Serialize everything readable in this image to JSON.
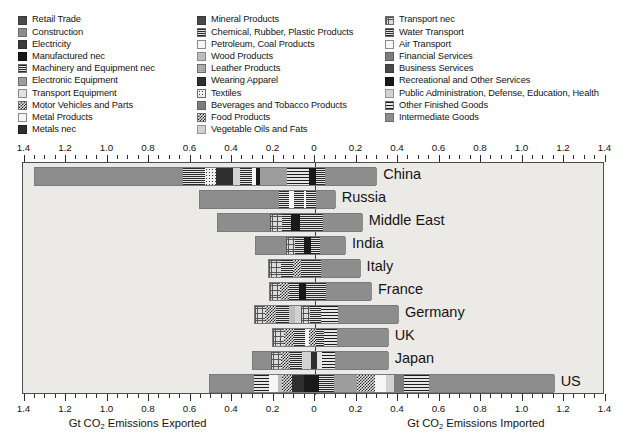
{
  "legend": {
    "columns": [
      {
        "items": [
          {
            "label": "Retail Trade",
            "pattern": "p-solid-dark"
          },
          {
            "label": "Construction",
            "pattern": "p-solid-mid"
          },
          {
            "label": "Electricity",
            "pattern": "p-solid-dark2"
          },
          {
            "label": "Manufactured nec",
            "pattern": "p-black"
          },
          {
            "label": "Machinery and Equipment nec",
            "pattern": "p-hline"
          },
          {
            "label": "Electronic Equipment",
            "pattern": "p-dot"
          },
          {
            "label": "Transport Equipment",
            "pattern": "p-light"
          },
          {
            "label": "Motor Vehicles and Parts",
            "pattern": "p-check"
          },
          {
            "label": "Metal Products",
            "pattern": "p-white"
          },
          {
            "label": "Metals nec",
            "pattern": "p-solid-darker"
          }
        ]
      },
      {
        "items": [
          {
            "label": "Mineral Products",
            "pattern": "p-solid-dark"
          },
          {
            "label": "Chemical, Rubber, Plastic Products",
            "pattern": "p-hline"
          },
          {
            "label": "Petroleum, Coal Products",
            "pattern": "p-white"
          },
          {
            "label": "Wood Products",
            "pattern": "p-lgray"
          },
          {
            "label": "Leather Products",
            "pattern": "p-mid-dot"
          },
          {
            "label": "Wearing Apparel",
            "pattern": "p-solid-darker"
          },
          {
            "label": "Textiles",
            "pattern": "p-sparse-dot"
          },
          {
            "label": "Beverages and Tobacco Products",
            "pattern": "p-med2"
          },
          {
            "label": "Food Products",
            "pattern": "p-check"
          },
          {
            "label": "Vegetable Oils and Fats",
            "pattern": "p-vlgray"
          }
        ]
      },
      {
        "items": [
          {
            "label": "Transport nec",
            "pattern": "p-grid"
          },
          {
            "label": "Water Transport",
            "pattern": "p-hline"
          },
          {
            "label": "Air Transport",
            "pattern": "p-white"
          },
          {
            "label": "Financial Services",
            "pattern": "p-med2"
          },
          {
            "label": "Business Services",
            "pattern": "p-solid-dark"
          },
          {
            "label": "Recreational and Other Services",
            "pattern": "p-black"
          },
          {
            "label": "Public Administration, Defense, Education, Health",
            "pattern": "p-vlgray"
          },
          {
            "label": "Other Finished Goods",
            "pattern": "p-hline-wide"
          },
          {
            "label": "Intermediate Goods",
            "pattern": "p-solid-mid"
          }
        ]
      }
    ]
  },
  "chart_data": {
    "type": "bar",
    "orientation": "horizontal-diverging-stacked",
    "title": "",
    "xlabel_left": "Gt CO₂ Emissions Exported",
    "xlabel_right": "Gt CO₂ Emissions Imported",
    "ylabel": "",
    "xlim": [
      -1.5,
      1.5
    ],
    "grid": false,
    "legend_position": "top",
    "tick_values": [
      -1.4,
      -1.2,
      -1.0,
      -0.8,
      -0.6,
      -0.4,
      -0.2,
      0,
      0.2,
      0.4,
      0.6,
      0.8,
      1.0,
      1.2,
      1.4
    ],
    "tick_labels": [
      "1.4",
      "1.2",
      "1.0",
      "0.8",
      "0.6",
      "0.4",
      "0.2",
      "0",
      "0.2",
      "0.4",
      "0.6",
      "0.8",
      "1.0",
      "1.2",
      "1.4"
    ],
    "categories": [
      "China",
      "Russia",
      "Middle East",
      "India",
      "Italy",
      "France",
      "Germany",
      "UK",
      "Japan",
      "US"
    ],
    "rows": [
      {
        "country": "China",
        "exported": 1.355,
        "imported": 0.295,
        "segments": [
          {
            "pattern": "p-solid-mid",
            "value": 0.715
          },
          {
            "pattern": "p-hline",
            "value": 0.105
          },
          {
            "pattern": "p-sparse-dot",
            "value": 0.052
          },
          {
            "pattern": "p-solid-darker",
            "value": 0.085
          },
          {
            "pattern": "p-vlgray",
            "value": 0.03
          },
          {
            "pattern": "p-hline",
            "value": 0.058
          },
          {
            "pattern": "p-white",
            "value": 0.022
          },
          {
            "pattern": "p-black",
            "value": 0.018
          },
          {
            "pattern": "p-dot",
            "value": 0.13
          },
          {
            "pattern": "p-hline-wide",
            "value": 0.105
          },
          {
            "pattern": "p-black",
            "value": 0.035
          },
          {
            "pattern": "p-hline",
            "value": 0.042
          },
          {
            "pattern": "p-solid-mid",
            "value": 0.253
          }
        ]
      },
      {
        "country": "Russia",
        "exported": 0.56,
        "imported": 0.095,
        "segments": [
          {
            "pattern": "p-solid-mid",
            "value": 0.38
          },
          {
            "pattern": "p-hline",
            "value": 0.048
          },
          {
            "pattern": "p-white",
            "value": 0.026
          },
          {
            "pattern": "p-hline",
            "value": 0.046
          },
          {
            "pattern": "p-white",
            "value": 0.012
          },
          {
            "pattern": "p-hline",
            "value": 0.05
          },
          {
            "pattern": "p-solid-mid",
            "value": 0.093
          }
        ]
      },
      {
        "country": "Middle East",
        "exported": 0.47,
        "imported": 0.225,
        "segments": [
          {
            "pattern": "p-solid-mid",
            "value": 0.25
          },
          {
            "pattern": "p-grid",
            "value": 0.055
          },
          {
            "pattern": "p-hline",
            "value": 0.045
          },
          {
            "pattern": "p-black",
            "value": 0.045
          },
          {
            "pattern": "p-hline",
            "value": 0.05
          },
          {
            "pattern": "p-hline",
            "value": 0.058
          },
          {
            "pattern": "p-solid-mid",
            "value": 0.192
          }
        ]
      },
      {
        "country": "India",
        "exported": 0.29,
        "imported": 0.145,
        "segments": [
          {
            "pattern": "p-solid-mid",
            "value": 0.145
          },
          {
            "pattern": "p-grid",
            "value": 0.045
          },
          {
            "pattern": "p-hline",
            "value": 0.04
          },
          {
            "pattern": "p-black",
            "value": 0.035
          },
          {
            "pattern": "p-hline",
            "value": 0.045
          },
          {
            "pattern": "p-solid-mid",
            "value": 0.125
          }
        ]
      },
      {
        "country": "Italy",
        "exported": 0.225,
        "imported": 0.215,
        "segments": [
          {
            "pattern": "p-grid",
            "value": 0.05
          },
          {
            "pattern": "p-hline",
            "value": 0.052
          },
          {
            "pattern": "p-check",
            "value": 0.038
          },
          {
            "pattern": "p-hline",
            "value": 0.04
          },
          {
            "pattern": "p-hline",
            "value": 0.045
          },
          {
            "pattern": "p-solid-mid",
            "value": 0.175
          }
        ]
      },
      {
        "country": "France",
        "exported": 0.22,
        "imported": 0.27,
        "segments": [
          {
            "pattern": "p-grid",
            "value": 0.048
          },
          {
            "pattern": "p-check",
            "value": 0.042
          },
          {
            "pattern": "p-hline",
            "value": 0.05
          },
          {
            "pattern": "p-black",
            "value": 0.03
          },
          {
            "pattern": "p-hline",
            "value": 0.05
          },
          {
            "pattern": "p-hline",
            "value": 0.046
          },
          {
            "pattern": "p-solid-mid",
            "value": 0.224
          }
        ]
      },
      {
        "country": "Germany",
        "exported": 0.295,
        "imported": 0.4,
        "segments": [
          {
            "pattern": "p-grid",
            "value": 0.048
          },
          {
            "pattern": "p-check",
            "value": 0.055
          },
          {
            "pattern": "p-hline",
            "value": 0.06
          },
          {
            "pattern": "p-lgray",
            "value": 0.032
          },
          {
            "pattern": "p-vlgray",
            "value": 0.028
          },
          {
            "pattern": "p-grid",
            "value": 0.045
          },
          {
            "pattern": "p-hline",
            "value": 0.05
          },
          {
            "pattern": "p-hline-wide",
            "value": 0.082
          },
          {
            "pattern": "p-solid-mid",
            "value": 0.295
          }
        ]
      },
      {
        "country": "UK",
        "exported": 0.205,
        "imported": 0.35,
        "segments": [
          {
            "pattern": "p-grid",
            "value": 0.05
          },
          {
            "pattern": "p-check",
            "value": 0.048
          },
          {
            "pattern": "p-hline",
            "value": 0.052
          },
          {
            "pattern": "p-white",
            "value": 0.02
          },
          {
            "pattern": "p-check",
            "value": 0.035
          },
          {
            "pattern": "p-hline",
            "value": 0.04
          },
          {
            "pattern": "p-hline-wide",
            "value": 0.06
          },
          {
            "pattern": "p-solid-mid",
            "value": 0.25
          }
        ]
      },
      {
        "country": "Japan",
        "exported": 0.305,
        "imported": 0.35,
        "segments": [
          {
            "pattern": "p-solid-mid",
            "value": 0.09
          },
          {
            "pattern": "p-grid",
            "value": 0.045
          },
          {
            "pattern": "p-check",
            "value": 0.045
          },
          {
            "pattern": "p-hline",
            "value": 0.06
          },
          {
            "pattern": "p-vlgray",
            "value": 0.04
          },
          {
            "pattern": "p-solid-darker",
            "value": 0.03
          },
          {
            "pattern": "p-light",
            "value": 0.022
          },
          {
            "pattern": "p-hline-wide",
            "value": 0.063
          },
          {
            "pattern": "p-solid-mid",
            "value": 0.26
          }
        ]
      },
      {
        "country": "US",
        "exported": 0.51,
        "imported": 1.15,
        "segments": [
          {
            "pattern": "p-solid-mid",
            "value": 0.21
          },
          {
            "pattern": "p-hline-wide",
            "value": 0.075
          },
          {
            "pattern": "p-white",
            "value": 0.04
          },
          {
            "pattern": "p-lgray",
            "value": 0.022
          },
          {
            "pattern": "p-check",
            "value": 0.048
          },
          {
            "pattern": "p-solid-darker",
            "value": 0.058
          },
          {
            "pattern": "p-black",
            "value": 0.07
          },
          {
            "pattern": "p-hline",
            "value": 0.072
          },
          {
            "pattern": "p-dot",
            "value": 0.115
          },
          {
            "pattern": "p-check",
            "value": 0.085
          },
          {
            "pattern": "p-white",
            "value": 0.055
          },
          {
            "pattern": "p-vlgray",
            "value": 0.035
          },
          {
            "pattern": "p-med2",
            "value": 0.048
          },
          {
            "pattern": "p-hline-wide",
            "value": 0.12
          },
          {
            "pattern": "p-solid-mid",
            "value": 0.607
          }
        ]
      }
    ]
  }
}
